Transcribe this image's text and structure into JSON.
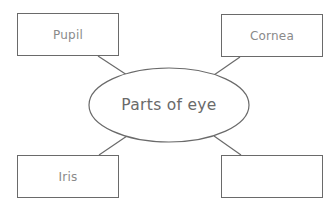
{
  "diagram": {
    "type": "mind-map",
    "center": {
      "label": "Parts of eye"
    },
    "nodes": [
      {
        "position": "top-left",
        "label": "Pupil"
      },
      {
        "position": "top-right",
        "label": "Cornea"
      },
      {
        "position": "bottom-left",
        "label": "Iris"
      },
      {
        "position": "bottom-right",
        "label": ""
      }
    ],
    "colors": {
      "stroke": "#6a6a6a",
      "node_text": "#8a8a8a",
      "center_text": "#6a6a6a",
      "background": "#ffffff"
    }
  }
}
